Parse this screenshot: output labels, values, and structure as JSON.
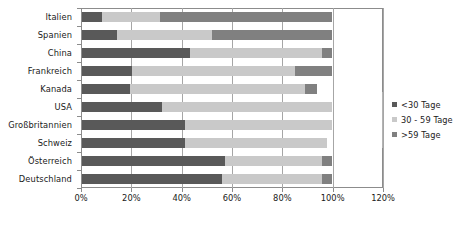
{
  "chart_data": {
    "type": "bar",
    "orientation": "horizontal",
    "stacked": true,
    "title": "",
    "xlabel": "",
    "ylabel": "",
    "xlim": [
      0,
      120
    ],
    "xticks": [
      0,
      20,
      40,
      60,
      80,
      100,
      120
    ],
    "xtick_labels": [
      "0%",
      "20%",
      "40%",
      "60%",
      "80%",
      "100%",
      "120%"
    ],
    "grid": true,
    "legend_position": "right",
    "categories": [
      "Italien",
      "Spanien",
      "China",
      "Frankreich",
      "Kanada",
      "USA",
      "Großbritannien",
      "Schweiz",
      "Österreich",
      "Deutschland"
    ],
    "series": [
      {
        "name": "<30 Tage",
        "color": "#595959",
        "values": [
          8,
          14,
          43,
          20,
          19,
          32,
          41,
          41,
          57,
          56
        ]
      },
      {
        "name": "30 - 59 Tage",
        "color": "#c9c9c9",
        "values": [
          23,
          38,
          53,
          65,
          70,
          68,
          59,
          57,
          39,
          40
        ]
      },
      {
        "name": ">59 Tage",
        "color": "#808080",
        "values": [
          69,
          48,
          4,
          15,
          5,
          0,
          0,
          0,
          4,
          4
        ]
      }
    ]
  },
  "legend": {
    "items": [
      {
        "label": "<30 Tage",
        "swatch": "s0"
      },
      {
        "label": "30 - 59 Tage",
        "swatch": "s1"
      },
      {
        "label": ">59 Tage",
        "swatch": "s2"
      }
    ]
  }
}
